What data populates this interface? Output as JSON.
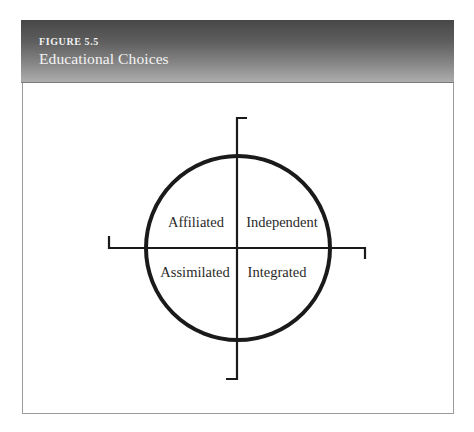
{
  "figure": {
    "number": "FIGURE 5.5",
    "title": "Educational Choices"
  },
  "diagram": {
    "type": "quadrant-circle",
    "quadrants": {
      "top_left": "Affiliated",
      "top_right": "Independent",
      "bottom_left": "Assimilated",
      "bottom_right": "Integrated"
    }
  },
  "colors": {
    "header_gradient_top": "#474747",
    "header_gradient_bottom": "#adadad",
    "header_text": "#f2f2f2",
    "line": "#1a1a1a",
    "label_text": "#2a2a2a",
    "border": "#9a9a9a"
  }
}
